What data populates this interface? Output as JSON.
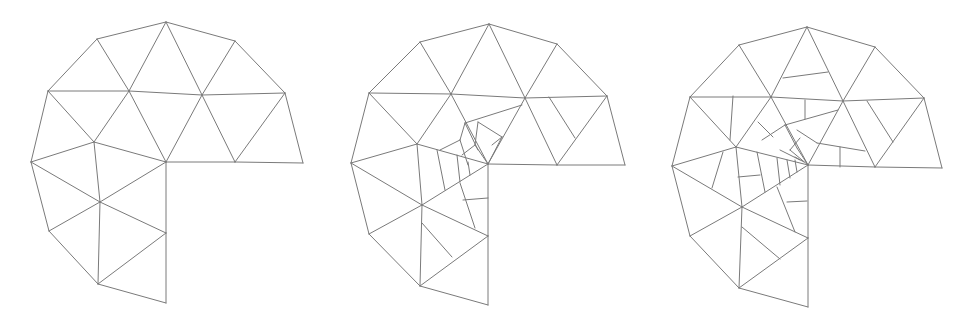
{
  "figure": {
    "line_color": "#7a7a7a",
    "background": "#ffffff",
    "panels": [
      {
        "id": "mesh-initial",
        "label": "initial mesh",
        "vertices": [
          [
            166,
            22
          ],
          [
            97,
            39
          ],
          [
            235,
            41
          ],
          [
            48,
            91
          ],
          [
            129,
            91
          ],
          [
            202,
            95
          ],
          [
            285,
            93
          ],
          [
            94,
            142
          ],
          [
            31,
            162
          ],
          [
            166,
            162
          ],
          [
            235,
            162
          ],
          [
            303,
            163
          ],
          [
            100,
            202
          ],
          [
            49,
            231
          ],
          [
            166,
            233
          ],
          [
            98,
            284
          ],
          [
            166,
            303
          ]
        ],
        "edges": [
          [
            0,
            1
          ],
          [
            0,
            2
          ],
          [
            0,
            4
          ],
          [
            0,
            5
          ],
          [
            1,
            3
          ],
          [
            1,
            4
          ],
          [
            2,
            5
          ],
          [
            2,
            6
          ],
          [
            3,
            4
          ],
          [
            4,
            5
          ],
          [
            5,
            6
          ],
          [
            3,
            7
          ],
          [
            4,
            7
          ],
          [
            4,
            9
          ],
          [
            5,
            9
          ],
          [
            5,
            10
          ],
          [
            6,
            10
          ],
          [
            6,
            11
          ],
          [
            3,
            8
          ],
          [
            7,
            8
          ],
          [
            7,
            9
          ],
          [
            9,
            10
          ],
          [
            10,
            11
          ],
          [
            7,
            12
          ],
          [
            8,
            12
          ],
          [
            9,
            12
          ],
          [
            8,
            13
          ],
          [
            12,
            13
          ],
          [
            12,
            14
          ],
          [
            9,
            14
          ],
          [
            13,
            15
          ],
          [
            12,
            15
          ],
          [
            14,
            15
          ],
          [
            15,
            16
          ],
          [
            14,
            16
          ]
        ],
        "extra_segments": []
      },
      {
        "id": "mesh-refined-1",
        "label": "first refinement",
        "vertices": [
          [
            489,
            24
          ],
          [
            420,
            42
          ],
          [
            557,
            44
          ],
          [
            369,
            93
          ],
          [
            451,
            94
          ],
          [
            525,
            98
          ],
          [
            607,
            96
          ],
          [
            417,
            144
          ],
          [
            351,
            163
          ],
          [
            488,
            164
          ],
          [
            557,
            165
          ],
          [
            625,
            165
          ],
          [
            422,
            205
          ],
          [
            369,
            234
          ],
          [
            488,
            236
          ],
          [
            420,
            286
          ],
          [
            488,
            305
          ]
        ],
        "edges": [
          [
            0,
            1
          ],
          [
            0,
            2
          ],
          [
            0,
            4
          ],
          [
            0,
            5
          ],
          [
            1,
            3
          ],
          [
            1,
            4
          ],
          [
            2,
            5
          ],
          [
            2,
            6
          ],
          [
            3,
            4
          ],
          [
            4,
            5
          ],
          [
            5,
            6
          ],
          [
            3,
            7
          ],
          [
            4,
            7
          ],
          [
            4,
            9
          ],
          [
            5,
            9
          ],
          [
            5,
            10
          ],
          [
            6,
            10
          ],
          [
            6,
            11
          ],
          [
            3,
            8
          ],
          [
            7,
            8
          ],
          [
            7,
            9
          ],
          [
            9,
            10
          ],
          [
            10,
            11
          ],
          [
            7,
            12
          ],
          [
            8,
            12
          ],
          [
            9,
            12
          ],
          [
            8,
            13
          ],
          [
            12,
            13
          ],
          [
            12,
            14
          ],
          [
            9,
            14
          ],
          [
            13,
            15
          ],
          [
            12,
            15
          ],
          [
            14,
            15
          ],
          [
            15,
            16
          ],
          [
            14,
            16
          ]
        ],
        "extra_segments": [
          [
            [
              465,
              123
            ],
            [
              522,
              105
            ]
          ],
          [
            [
              465,
              123
            ],
            [
              478,
              150
            ]
          ],
          [
            [
              478,
              122
            ],
            [
              502,
              137
            ]
          ],
          [
            [
              502,
              137
            ],
            [
              488,
              164
            ]
          ],
          [
            [
              478,
              122
            ],
            [
              475,
              145
            ]
          ],
          [
            [
              475,
              145
            ],
            [
              488,
              164
            ]
          ],
          [
            [
              465,
              123
            ],
            [
              460,
              140
            ]
          ],
          [
            [
              460,
              140
            ],
            [
              468,
              165
            ]
          ],
          [
            [
              502,
              137
            ],
            [
              492,
              145
            ]
          ],
          [
            [
              475,
              145
            ],
            [
              462,
              155
            ]
          ],
          [
            [
              460,
              140
            ],
            [
              440,
              150
            ]
          ],
          [
            [
              437,
              150
            ],
            [
              445,
              190
            ]
          ],
          [
            [
              457,
              155
            ],
            [
              460,
              182
            ]
          ],
          [
            [
              468,
              162
            ],
            [
              470,
              175
            ]
          ],
          [
            [
              460,
              183
            ],
            [
              475,
              228
            ]
          ],
          [
            [
              463,
              200
            ],
            [
              488,
              198
            ]
          ],
          [
            [
              422,
              223
            ],
            [
              452,
              257
            ]
          ],
          [
            [
              549,
              97
            ],
            [
              575,
              138
            ]
          ]
        ]
      },
      {
        "id": "mesh-refined-2",
        "label": "second refinement",
        "vertices": [
          [
            807,
            27
          ],
          [
            739,
            45
          ],
          [
            875,
            47
          ],
          [
            690,
            97
          ],
          [
            771,
            97
          ],
          [
            843,
            101
          ],
          [
            924,
            98
          ],
          [
            736,
            147
          ],
          [
            672,
            166
          ],
          [
            808,
            165
          ],
          [
            875,
            167
          ],
          [
            942,
            168
          ],
          [
            742,
            207
          ],
          [
            690,
            236
          ],
          [
            808,
            238
          ],
          [
            739,
            288
          ],
          [
            808,
            307
          ]
        ],
        "edges": [
          [
            0,
            1
          ],
          [
            0,
            2
          ],
          [
            0,
            4
          ],
          [
            0,
            5
          ],
          [
            1,
            3
          ],
          [
            1,
            4
          ],
          [
            2,
            5
          ],
          [
            2,
            6
          ],
          [
            3,
            4
          ],
          [
            4,
            5
          ],
          [
            5,
            6
          ],
          [
            3,
            7
          ],
          [
            4,
            7
          ],
          [
            4,
            9
          ],
          [
            5,
            9
          ],
          [
            5,
            10
          ],
          [
            6,
            10
          ],
          [
            6,
            11
          ],
          [
            3,
            8
          ],
          [
            7,
            8
          ],
          [
            7,
            9
          ],
          [
            9,
            10
          ],
          [
            10,
            11
          ],
          [
            7,
            12
          ],
          [
            8,
            12
          ],
          [
            9,
            12
          ],
          [
            8,
            13
          ],
          [
            12,
            13
          ],
          [
            12,
            14
          ],
          [
            9,
            14
          ],
          [
            13,
            15
          ],
          [
            12,
            15
          ],
          [
            14,
            15
          ],
          [
            15,
            16
          ],
          [
            14,
            16
          ]
        ],
        "extra_segments": [
          [
            [
              783,
              78
            ],
            [
              828,
              72
            ]
          ],
          [
            [
              733,
              96
            ],
            [
              730,
              140
            ]
          ],
          [
            [
              758,
              122
            ],
            [
              773,
              137
            ]
          ],
          [
            [
              805,
              100
            ],
            [
              805,
              119
            ]
          ],
          [
            [
              785,
              125
            ],
            [
              838,
              110
            ]
          ],
          [
            [
              785,
              125
            ],
            [
              762,
              140
            ]
          ],
          [
            [
              785,
              125
            ],
            [
              797,
              148
            ]
          ],
          [
            [
              797,
              130
            ],
            [
              817,
              143
            ]
          ],
          [
            [
              800,
              138
            ],
            [
              790,
              150
            ]
          ],
          [
            [
              797,
              148
            ],
            [
              808,
              165
            ]
          ],
          [
            [
              790,
              150
            ],
            [
              808,
              165
            ]
          ],
          [
            [
              780,
              150
            ],
            [
              800,
              160
            ]
          ],
          [
            [
              795,
              157
            ],
            [
              804,
              162
            ]
          ],
          [
            [
              723,
              152
            ],
            [
              712,
              188
            ]
          ],
          [
            [
              738,
              177
            ],
            [
              760,
              175
            ]
          ],
          [
            [
              757,
              152
            ],
            [
              765,
              192
            ]
          ],
          [
            [
              777,
              158
            ],
            [
              780,
              185
            ]
          ],
          [
            [
              787,
              160
            ],
            [
              790,
              178
            ]
          ],
          [
            [
              795,
              160
            ],
            [
              797,
              172
            ]
          ],
          [
            [
              817,
              143
            ],
            [
              865,
              151
            ]
          ],
          [
            [
              840,
              147
            ],
            [
              840,
              167
            ]
          ],
          [
            [
              867,
              101
            ],
            [
              893,
              142
            ]
          ],
          [
            [
              777,
              187
            ],
            [
              795,
              232
            ]
          ],
          [
            [
              787,
              202
            ],
            [
              807,
              201
            ]
          ],
          [
            [
              742,
              227
            ],
            [
              780,
              259
            ]
          ]
        ]
      }
    ]
  }
}
